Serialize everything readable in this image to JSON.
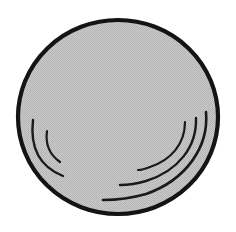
{
  "figure": {
    "description": "Monochrome line drawing of a round shallow vessel seen from above, filled with a dithered light-gray halftone, outlined by a thick black circle, with two short concentric arcs at the lower left and three longer concentric arcs at the lower right.",
    "background_color": "#ffffff",
    "canvas": {
      "width": 236,
      "height": 232
    }
  },
  "shapes": {
    "body": {
      "name": "circle-body",
      "shape": "circle",
      "center_x": 118,
      "center_y": 117,
      "radius_x": 100,
      "radius_y": 97,
      "fill_color": "#c2c2c2",
      "fill_texture": "halftone-dither",
      "stroke_color": "#141414",
      "stroke_width": 4.2
    },
    "arcs": {
      "stroke_color": "#1a1a1a",
      "left_group_label": "left arc group",
      "right_group_label": "right arc group",
      "items": [
        {
          "name": "arc-left-outer",
          "side": "left",
          "stroke_width": 2.4,
          "path": "M 33 120 C 30 146, 38 166, 63 176"
        },
        {
          "name": "arc-left-inner",
          "side": "left",
          "stroke_width": 2.2,
          "path": "M 47 131 C 45 145, 50 155, 60 162"
        },
        {
          "name": "arc-right-outer",
          "side": "right",
          "stroke_width": 2.6,
          "path": "M 206 112 C 209 147, 186 180, 146 194 C 132 198, 116 200, 103 200"
        },
        {
          "name": "arc-right-middle",
          "side": "right",
          "stroke_width": 2.4,
          "path": "M 196 118 C 197 147, 178 171, 146 181 C 136 184, 127 185, 120 185"
        },
        {
          "name": "arc-right-inner",
          "side": "right",
          "stroke_width": 2.2,
          "path": "M 185 122 C 185 144, 171 160, 150 167 C 145 169, 141 170, 138 170"
        }
      ]
    }
  },
  "colors": {
    "outline": "#141414",
    "fill": "#c2c2c2",
    "arc": "#1a1a1a",
    "background": "#ffffff"
  }
}
